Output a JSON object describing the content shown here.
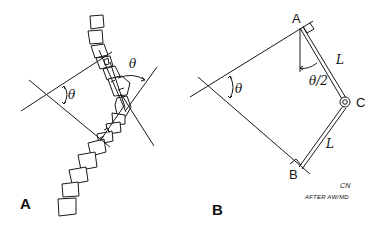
{
  "figure": {
    "panel_a": {
      "label": "A",
      "angle_left": "θ",
      "angle_right": "θ",
      "description": "Curved spine with vertebrae; perpendicular lines from end vertebrae intersecting to form angle θ"
    },
    "panel_b": {
      "label": "B",
      "point_a": "A",
      "point_b": "B",
      "point_c": "C",
      "segment_ac": "L",
      "segment_cb": "L",
      "angle_main": "θ",
      "angle_half": "θ/2"
    },
    "credit": {
      "initials": "CN",
      "line": "AFTER AW/MD"
    }
  },
  "colors": {
    "ink": "#1a1a1a",
    "background": "#ffffff"
  }
}
